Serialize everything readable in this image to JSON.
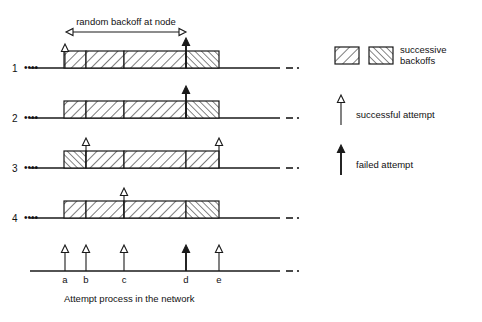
{
  "figure": {
    "top_annotation": "random backoff at node",
    "bottom_caption": "Attempt process in the network",
    "row_labels": [
      "1",
      "2",
      "3",
      "4"
    ],
    "row_leader": "••••",
    "line_tail": "– ·"
  },
  "legend": {
    "swatch_a_name": "hatch-wide-swatch",
    "swatch_b_name": "hatch-dense-swatch",
    "swatch_label_line1": "successive",
    "swatch_label_line2": "backoffs",
    "successful_label": "successful attempt",
    "failed_label": "failed attempt"
  },
  "timeline": {
    "tick_labels": [
      "a",
      "b",
      "c",
      "d",
      "e"
    ],
    "tick_x": [
      65,
      86,
      124,
      186,
      219
    ],
    "tick_types": [
      "successful",
      "successful",
      "successful",
      "failed",
      "successful"
    ]
  },
  "axis": {
    "x_start": 30,
    "x_end": 280,
    "dash_x": 286,
    "dot_x": 296
  },
  "rows": [
    {
      "label": "1",
      "baseline_y": 68,
      "box_start": 64,
      "box_end": 219,
      "dividers": [
        86,
        124,
        186
      ],
      "fills": [
        "wide",
        "wide",
        "wide",
        "dense"
      ],
      "arrows": [
        {
          "x": 65,
          "type": "successful",
          "height": 24
        },
        {
          "x": 186,
          "type": "failed",
          "height": 30
        }
      ]
    },
    {
      "label": "2",
      "baseline_y": 118,
      "box_start": 64,
      "box_end": 219,
      "dividers": [
        86,
        124,
        186
      ],
      "fills": [
        "wide",
        "wide",
        "wide",
        "dense"
      ],
      "arrows": [
        {
          "x": 186,
          "type": "failed",
          "height": 32
        }
      ]
    },
    {
      "label": "3",
      "baseline_y": 168,
      "box_start": 64,
      "box_end": 219,
      "dividers": [
        86,
        124,
        186
      ],
      "fills": [
        "dense",
        "wide",
        "wide",
        "wide"
      ],
      "arrows": [
        {
          "x": 86,
          "type": "successful",
          "height": 30
        },
        {
          "x": 219,
          "type": "successful",
          "height": 30
        }
      ]
    },
    {
      "label": "4",
      "baseline_y": 218,
      "box_start": 64,
      "box_end": 219,
      "dividers": [
        86,
        124,
        186
      ],
      "fills": [
        "wide",
        "wide",
        "wide",
        "dense"
      ],
      "arrows": [
        {
          "x": 124,
          "type": "successful",
          "height": 30
        }
      ]
    }
  ],
  "bottom_axis": {
    "baseline_y": 271,
    "arrow_height": 26
  },
  "colors": {
    "ink": "#111111",
    "line": "#1a1a1a",
    "paper": "#ffffff"
  },
  "box_height": 17
}
